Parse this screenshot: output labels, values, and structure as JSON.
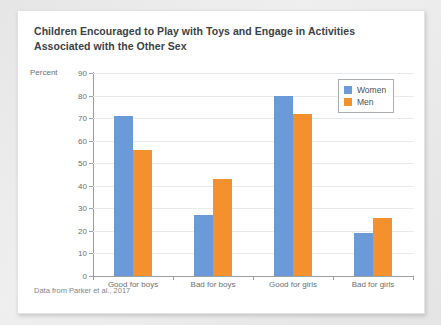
{
  "card": {
    "title": "Children Encouraged to Play with Toys and Engage in Activities Associated with the Other Sex",
    "source": "Data from Parker et al., 2017"
  },
  "chart_data": {
    "type": "bar",
    "title": "Children Encouraged to Play with Toys and Engage in Activities Associated with the Other Sex",
    "categories": [
      "Good for boys",
      "Bad for boys",
      "Good for girls",
      "Bad for girls"
    ],
    "series": [
      {
        "name": "Women",
        "color": "#6a9bd8",
        "values": [
          71,
          27,
          80,
          19
        ]
      },
      {
        "name": "Men",
        "color": "#f5902e",
        "values": [
          56,
          43,
          72,
          25.5
        ]
      }
    ],
    "xlabel": "",
    "ylabel": "Percent",
    "ylim": [
      0,
      90
    ],
    "yticks": [
      0,
      10,
      20,
      30,
      40,
      50,
      60,
      70,
      80,
      90
    ],
    "ytick_labels": [
      "0",
      "10",
      "20",
      "30",
      "40",
      "50",
      "60",
      "70",
      "80",
      "90"
    ],
    "grid": true,
    "legend_position": "top-right",
    "source": "Data from Parker et al., 2017"
  }
}
